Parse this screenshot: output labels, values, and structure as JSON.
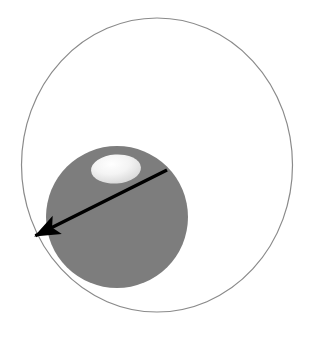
{
  "figure": {
    "title": "",
    "background_color": "#ffffff",
    "width": 320,
    "height": 339
  },
  "diagram_data": {
    "type": "geometric-diagram",
    "description": "Large thin outlined circle (orbit) containing a solid gray filled sphere with a small light elliptical highlight near its top, and a thick black arrow drawn across the sphere pointing down-left toward the orbit edge.",
    "shapes": [
      {
        "name": "outer-orbit-circle",
        "kind": "ellipse",
        "cx": 157,
        "cy": 165,
        "rx": 135.5,
        "ry": 147,
        "fill": "none",
        "stroke": "#8a8a8a",
        "stroke_width": 1.2,
        "bounds": {
          "left": 21,
          "top": 18,
          "right": 292,
          "bottom": 312
        }
      },
      {
        "name": "gray-sphere",
        "kind": "circle",
        "cx": 117,
        "cy": 217,
        "r": 71,
        "fill": "#7d7d7d",
        "stroke": "none",
        "bounds": {
          "left": 46,
          "top": 146,
          "right": 188,
          "bottom": 288
        }
      },
      {
        "name": "light-ellipse-highlight",
        "kind": "ellipse",
        "cx": 116,
        "cy": 169,
        "rx": 25,
        "ry": 14.5,
        "rotation_deg": -4,
        "fill_start": "#ffffff",
        "fill_end": "#d2d2d2",
        "stroke": "none",
        "bounds": {
          "left": 91,
          "top": 154,
          "right": 141,
          "bottom": 184
        }
      },
      {
        "name": "radius-arrow",
        "kind": "arrow",
        "x1": 167,
        "y1": 170,
        "x2": 41,
        "y2": 233,
        "stroke": "#000000",
        "stroke_width": 3.4,
        "arrowhead_at": "end",
        "arrowhead_length": 15,
        "arrowhead_width": 11
      }
    ],
    "colors": {
      "background": "#ffffff",
      "orbit_stroke": "#8a8a8a",
      "sphere_fill": "#7d7d7d",
      "highlight_light": "#ffffff",
      "highlight_dark": "#d2d2d2",
      "arrow": "#000000"
    },
    "labels": [],
    "annotations": []
  }
}
